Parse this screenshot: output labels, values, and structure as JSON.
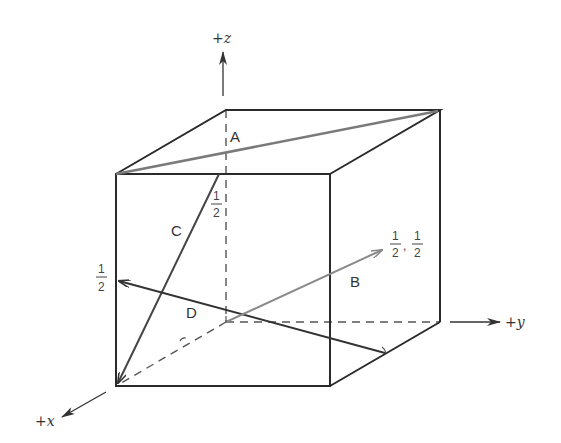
{
  "diagram": {
    "type": "unit-cube-crystallographic-directions",
    "axes": {
      "z": "+z",
      "y": "+y",
      "x": "+x"
    },
    "vectors": [
      {
        "label": "A",
        "color": "#7a7a7a"
      },
      {
        "label": "B",
        "color": "#8a8a8a"
      },
      {
        "label": "C",
        "color": "#444444"
      },
      {
        "label": "D",
        "color": "#333333"
      }
    ],
    "fractions": {
      "c_top": {
        "num": "1",
        "den": "2"
      },
      "d_left": {
        "num": "1",
        "den": "2"
      },
      "b_end": {
        "num1": "1",
        "den1": "2",
        "sep": ",",
        "num2": "1",
        "den2": "2"
      }
    },
    "colors": {
      "edge": "#2a2a2a",
      "dashed": "#555555",
      "background": "#ffffff"
    }
  }
}
